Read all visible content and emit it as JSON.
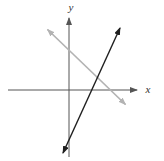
{
  "figure": {
    "kind": "coordinate-plane-graph",
    "background": "#ffffff",
    "axis_labels": {
      "x": "x",
      "y": "y"
    },
    "colors": {
      "axis": "#555555",
      "label": "#333333",
      "line_steep": "#1f1f1f",
      "line_shallow": "#b3b3b3"
    },
    "geometry": {
      "x_axis": {
        "x1": 8,
        "y1": 90,
        "x2": 137,
        "y2": 90
      },
      "y_axis": {
        "x1": 69,
        "y1": 157,
        "x2": 69,
        "y2": 18
      },
      "line_steep": {
        "x1": 63,
        "y1": 153,
        "x2": 120,
        "y2": 28
      },
      "line_shallow": {
        "x1": 47.5,
        "y1": 29.5,
        "x2": 125.5,
        "y2": 104.5
      },
      "x_label": {
        "x": 148,
        "y": 93
      },
      "y_label": {
        "x": 71,
        "y": 11
      }
    },
    "lines": [
      {
        "name": "steep-line",
        "slope_sign": "positive",
        "style": "dark",
        "crosses_x_axis_right_of_origin": true,
        "crosses_y_axis_below_origin": true
      },
      {
        "name": "shallow-line",
        "slope_sign": "negative",
        "style": "gray",
        "crosses_x_axis_right_of_origin": true,
        "crosses_y_axis_above_origin": true
      }
    ]
  }
}
